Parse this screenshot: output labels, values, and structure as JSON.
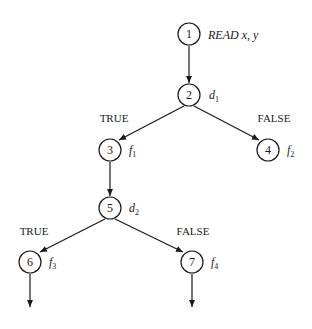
{
  "diagram": {
    "type": "control-flow-graph",
    "nodes": [
      {
        "id": "1",
        "label": "1",
        "annotation": "READ x, y",
        "cx": 189,
        "cy": 34
      },
      {
        "id": "2",
        "label": "2",
        "annotation": "d",
        "annotation_sub": "1",
        "cx": 189,
        "cy": 95
      },
      {
        "id": "3",
        "label": "3",
        "annotation": "f",
        "annotation_sub": "1",
        "cx": 110,
        "cy": 150
      },
      {
        "id": "4",
        "label": "4",
        "annotation": "f",
        "annotation_sub": "2",
        "cx": 268,
        "cy": 150
      },
      {
        "id": "5",
        "label": "5",
        "annotation": "d",
        "annotation_sub": "2",
        "cx": 110,
        "cy": 208
      },
      {
        "id": "6",
        "label": "6",
        "annotation": "f",
        "annotation_sub": "3",
        "cx": 30,
        "cy": 262
      },
      {
        "id": "7",
        "label": "7",
        "annotation": "f",
        "annotation_sub": "4",
        "cx": 192,
        "cy": 262
      }
    ],
    "edges": [
      {
        "from": "1",
        "to": "2"
      },
      {
        "from": "2",
        "to": "3",
        "label": "TRUE"
      },
      {
        "from": "2",
        "to": "4",
        "label": "FALSE"
      },
      {
        "from": "3",
        "to": "5"
      },
      {
        "from": "5",
        "to": "6",
        "label": "TRUE"
      },
      {
        "from": "5",
        "to": "7",
        "label": "FALSE"
      },
      {
        "from": "6",
        "to": "exit"
      },
      {
        "from": "7",
        "to": "exit"
      }
    ],
    "branch_labels": {
      "d1_true": "TRUE",
      "d1_false": "FALSE",
      "d2_true": "TRUE",
      "d2_false": "FALSE"
    }
  }
}
